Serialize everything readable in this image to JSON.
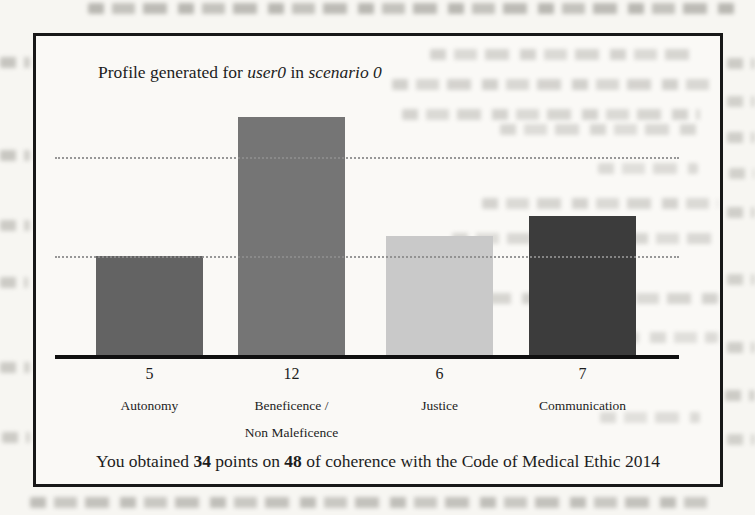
{
  "figure": {
    "title": {
      "prefix": "Profile generated for ",
      "user": "user0",
      "connector": " in ",
      "scenario": "scenario 0"
    },
    "summary": {
      "prefix": "You obtained ",
      "points": "34",
      "middle": " points on ",
      "total": "48",
      "suffix": " of coherence with the Code of Medical Ethic 2014"
    }
  },
  "chart_data": {
    "type": "bar",
    "title": "Profile generated for user0 in scenario 0",
    "categories": [
      "Autonomy",
      "Beneficence / Non Maleficence",
      "Justice",
      "Communication"
    ],
    "category_lines": [
      [
        "Autonomy"
      ],
      [
        "Beneficence /",
        "Non Maleficence"
      ],
      [
        "Justice"
      ],
      [
        "Communication"
      ]
    ],
    "values": [
      5,
      12,
      6,
      7
    ],
    "value_labels": [
      "5",
      "12",
      "6",
      "7"
    ],
    "bar_colors": [
      "#636363",
      "#757575",
      "#c9c9c9",
      "#3c3c3c"
    ],
    "xlabel": "",
    "ylabel": "",
    "ylim": [
      0,
      13
    ],
    "gridlines_at": [
      5,
      10
    ],
    "grid": "horizontal-dotted",
    "legend": "none",
    "axis_color": "#101010",
    "caption": "You obtained 34 points on 48 of coherence with the Code of Medical Ethic 2014"
  }
}
